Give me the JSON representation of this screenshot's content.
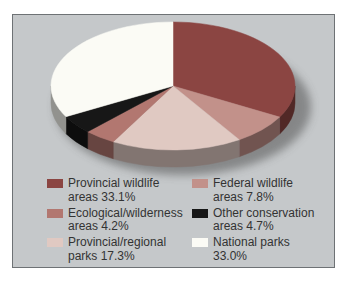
{
  "page": {
    "background": "#ffffff"
  },
  "panel": {
    "background": "#c5c8ca",
    "border_color": "#6e7275"
  },
  "chart_data": {
    "type": "pie",
    "style": "3d",
    "title": "",
    "start_angle_deg": -90,
    "direction": "clockwise",
    "slices": [
      {
        "label": "Provincial wildlife areas",
        "value": 33.1,
        "display": "33.1%",
        "color": "#8b4542"
      },
      {
        "label": "Federal wildlife areas",
        "value": 7.8,
        "display": "7.8%",
        "color": "#c2918a"
      },
      {
        "label": "Provincial/regional parks",
        "value": 17.3,
        "display": "17.3%",
        "color": "#e0c9c2"
      },
      {
        "label": "Ecological/wilderness areas",
        "value": 4.2,
        "display": "4.2%",
        "color": "#b27770"
      },
      {
        "label": "Other conservation areas",
        "value": 4.7,
        "display": "4.7%",
        "color": "#171717"
      },
      {
        "label": "National parks",
        "value": 33.0,
        "display": "33.0%",
        "color": "#fbfbf5"
      }
    ],
    "shadow_color": "#474747",
    "legend_position": "bottom"
  },
  "legend": {
    "text_color": "#333333",
    "columns": [
      {
        "items": [
          {
            "line1": "Provincial wildlife",
            "line2": "areas 33.1%",
            "slice_index": 0
          },
          {
            "line1": "Ecological/wilderness",
            "line2": "areas 4.2%",
            "slice_index": 3
          },
          {
            "line1": "Provincial/regional",
            "line2": "parks 17.3%",
            "slice_index": 2
          }
        ]
      },
      {
        "items": [
          {
            "line1": "Federal wildlife",
            "line2": "areas 7.8%",
            "slice_index": 1
          },
          {
            "line1": "Other conservation",
            "line2": "areas 4.7%",
            "slice_index": 4
          },
          {
            "line1": "National parks",
            "line2": "33.0%",
            "slice_index": 5
          }
        ]
      }
    ]
  }
}
